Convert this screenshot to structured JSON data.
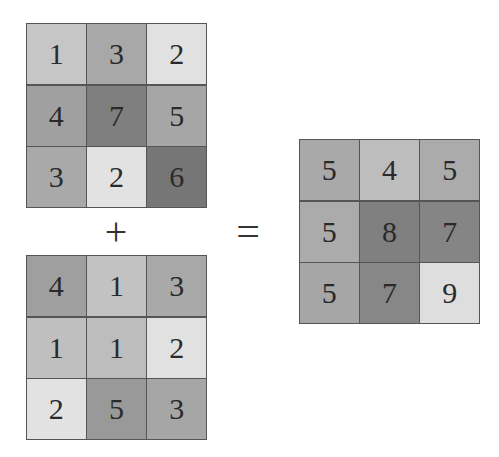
{
  "diagram": {
    "operators": {
      "plus": "+",
      "equals": "="
    },
    "matrices": {
      "a": {
        "label": "Matrix A",
        "cells": [
          {
            "value": "1",
            "color": "#c6c6c6"
          },
          {
            "value": "3",
            "color": "#a8a8a8"
          },
          {
            "value": "2",
            "color": "#e1e1e1"
          },
          {
            "value": "4",
            "color": "#a0a0a0"
          },
          {
            "value": "7",
            "color": "#7f7f7f"
          },
          {
            "value": "5",
            "color": "#a6a6a6"
          },
          {
            "value": "3",
            "color": "#a9a9a9"
          },
          {
            "value": "2",
            "color": "#e2e2e2"
          },
          {
            "value": "6",
            "color": "#767676"
          }
        ]
      },
      "b": {
        "label": "Matrix B",
        "cells": [
          {
            "value": "4",
            "color": "#9f9f9f"
          },
          {
            "value": "1",
            "color": "#c2c2c2"
          },
          {
            "value": "3",
            "color": "#a9a9a9"
          },
          {
            "value": "1",
            "color": "#bfbfbf"
          },
          {
            "value": "1",
            "color": "#bdbdbd"
          },
          {
            "value": "2",
            "color": "#e1e1e1"
          },
          {
            "value": "2",
            "color": "#e2e2e2"
          },
          {
            "value": "5",
            "color": "#999999"
          },
          {
            "value": "3",
            "color": "#a6a6a6"
          }
        ]
      },
      "c": {
        "label": "Result",
        "cells": [
          {
            "value": "5",
            "color": "#a9a9a9"
          },
          {
            "value": "4",
            "color": "#bdbdbd"
          },
          {
            "value": "5",
            "color": "#ababab"
          },
          {
            "value": "5",
            "color": "#ababab"
          },
          {
            "value": "8",
            "color": "#808080"
          },
          {
            "value": "7",
            "color": "#858585"
          },
          {
            "value": "5",
            "color": "#a6a6a6"
          },
          {
            "value": "7",
            "color": "#878787"
          },
          {
            "value": "9",
            "color": "#dedede"
          }
        ]
      }
    }
  }
}
